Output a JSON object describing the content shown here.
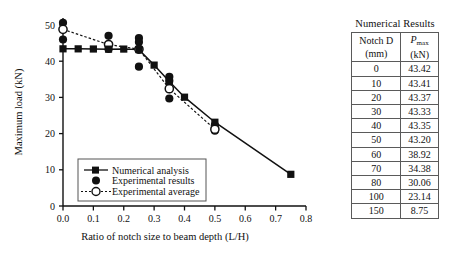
{
  "chart_data": {
    "type": "line",
    "title": "",
    "xlabel": "Ratio of notch size to beam depth (L/H)",
    "ylabel": "Maximum load (kN)",
    "xlim": [
      0.0,
      0.8
    ],
    "ylim": [
      0,
      50
    ],
    "xticks": [
      "0.0",
      "0.1",
      "0.2",
      "0.3",
      "0.4",
      "0.5",
      "0.6",
      "0.7",
      "0.8"
    ],
    "xtick_values": [
      0.0,
      0.1,
      0.2,
      0.3,
      0.4,
      0.5,
      0.6,
      0.7,
      0.8
    ],
    "yticks": [
      "0",
      "10",
      "20",
      "30",
      "40",
      "50"
    ],
    "ytick_values": [
      0,
      10,
      20,
      30,
      40,
      50
    ],
    "grid": false,
    "legend_position": "lower-left-inside",
    "series": [
      {
        "name": "Numerical analysis",
        "marker": "filled-square",
        "line": "solid",
        "x": [
          0.0,
          0.05,
          0.1,
          0.15,
          0.2,
          0.25,
          0.3,
          0.35,
          0.4,
          0.5,
          0.75
        ],
        "values": [
          43.42,
          43.41,
          43.37,
          43.33,
          43.35,
          43.2,
          38.92,
          34.38,
          30.06,
          23.14,
          8.75
        ]
      },
      {
        "name": "Experimental average",
        "marker": "open-circle",
        "line": "dotted",
        "x": [
          0.0,
          0.15,
          0.25,
          0.35,
          0.5
        ],
        "values": [
          48.8,
          44.6,
          43.3,
          32.4,
          21.2
        ]
      },
      {
        "name": "Experimental results",
        "marker": "filled-circle",
        "line": "none",
        "points": [
          {
            "x": 0.0,
            "y": 50.6
          },
          {
            "x": 0.0,
            "y": 46.0
          },
          {
            "x": 0.15,
            "y": 47.0
          },
          {
            "x": 0.15,
            "y": 43.4
          },
          {
            "x": 0.25,
            "y": 46.4
          },
          {
            "x": 0.25,
            "y": 45.3
          },
          {
            "x": 0.25,
            "y": 38.5
          },
          {
            "x": 0.35,
            "y": 35.7
          },
          {
            "x": 0.35,
            "y": 34.6
          },
          {
            "x": 0.35,
            "y": 32.3
          },
          {
            "x": 0.35,
            "y": 29.7
          },
          {
            "x": 0.5,
            "y": 22.3
          },
          {
            "x": 0.5,
            "y": 20.8
          }
        ]
      }
    ],
    "legend": [
      "Numerical analysis",
      "Experimental results",
      "Experimental average"
    ]
  },
  "table": {
    "caption": "Numerical Results",
    "columns": [
      {
        "line1": "Notch D",
        "line2": "(mm)"
      },
      {
        "line1_pre": "P",
        "line1_sub": "max",
        "line2": "(kN)"
      }
    ],
    "rows": [
      {
        "notch": "0",
        "pmax": "43.42"
      },
      {
        "notch": "10",
        "pmax": "43.41"
      },
      {
        "notch": "20",
        "pmax": "43.37"
      },
      {
        "notch": "30",
        "pmax": "43.33"
      },
      {
        "notch": "40",
        "pmax": "43.35"
      },
      {
        "notch": "50",
        "pmax": "43.20"
      },
      {
        "notch": "60",
        "pmax": "38.92"
      },
      {
        "notch": "70",
        "pmax": "34.38"
      },
      {
        "notch": "80",
        "pmax": "30.06"
      },
      {
        "notch": "100",
        "pmax": "23.14"
      },
      {
        "notch": "150",
        "pmax": "8.75"
      }
    ]
  },
  "colors": {
    "ink": "#111111",
    "table_border": "#5a5a5a",
    "background": "#ffffff"
  }
}
